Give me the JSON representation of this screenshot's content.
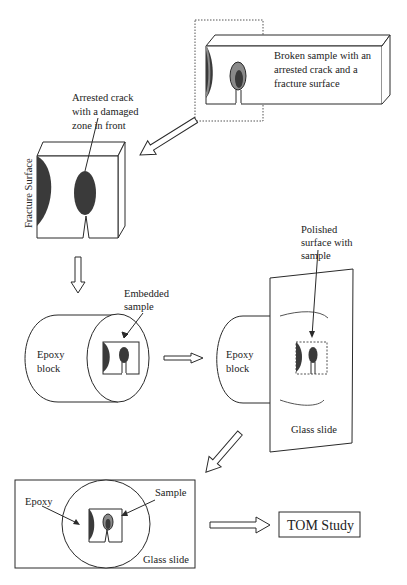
{
  "colors": {
    "stroke": "#2a2a2a",
    "dark_zone": "#3a3a3a",
    "mid_zone": "#8a8a8a",
    "background": "#ffffff"
  },
  "labels": {
    "broken_sample": [
      "Broken sample with an",
      "arrested crack and a",
      "fracture surface"
    ],
    "arrested_crack": [
      "Arrested crack",
      "with a damaged",
      "zone in front"
    ],
    "fracture_surface": "Fracture Surface",
    "embedded_sample": [
      "Embedded",
      "sample"
    ],
    "epoxy_block_1": [
      "Epoxy",
      "block"
    ],
    "epoxy_block_2": [
      "Epoxy",
      "block"
    ],
    "polished_surface": [
      "Polished",
      "surface with",
      "sample"
    ],
    "glass_slide_1": "Glass slide",
    "epoxy": "Epoxy",
    "sample": "Sample",
    "glass_slide_2": "Glass slide",
    "tom_study": "TOM Study"
  }
}
